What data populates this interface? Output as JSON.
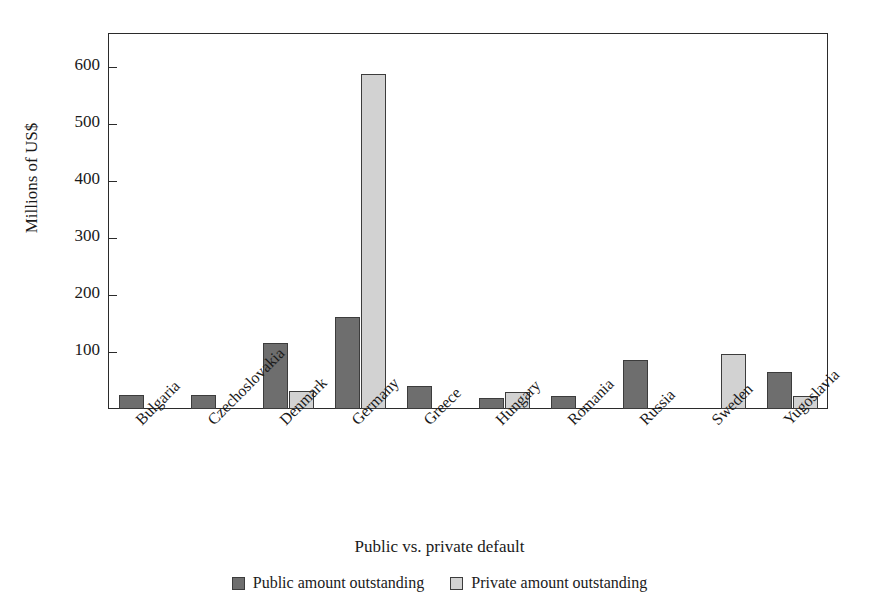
{
  "figure": {
    "clipped_top_title": "",
    "background_color": "#ffffff"
  },
  "chart_data": {
    "type": "bar",
    "title": "",
    "xlabel": "Public vs. private default",
    "ylabel": "Millions of US$",
    "categories": [
      "Bulgaria",
      "Czechoslovakia",
      "Denmark",
      "Germany",
      "Greece",
      "Hungary",
      "Romania",
      "Russia",
      "Sweden",
      "Yugoslavia"
    ],
    "series": [
      {
        "name": "Public amount outstanding",
        "color": "#6e6e6e",
        "values": [
          25,
          25,
          116,
          161,
          41,
          19,
          23,
          86,
          0,
          65
        ]
      },
      {
        "name": "Private amount outstanding",
        "color": "#d2d2d2",
        "values": [
          0,
          0,
          32,
          588,
          0,
          30,
          0,
          0,
          97,
          22
        ]
      }
    ],
    "ylim": [
      0,
      660
    ],
    "yticks": [
      100,
      200,
      300,
      400,
      500,
      600
    ],
    "ytick_labels": [
      "100",
      "200",
      "300",
      "400",
      "500",
      "600"
    ],
    "grid": false,
    "legend_position": "bottom",
    "xlabel_rotation_deg": -45
  },
  "axis": {
    "y_title": "Millions of US$",
    "x_title": "Public vs. private default"
  },
  "legend": {
    "entries": [
      {
        "label": "Public amount outstanding",
        "swatch": "public"
      },
      {
        "label": "Private amount outstanding",
        "swatch": "private"
      }
    ]
  }
}
